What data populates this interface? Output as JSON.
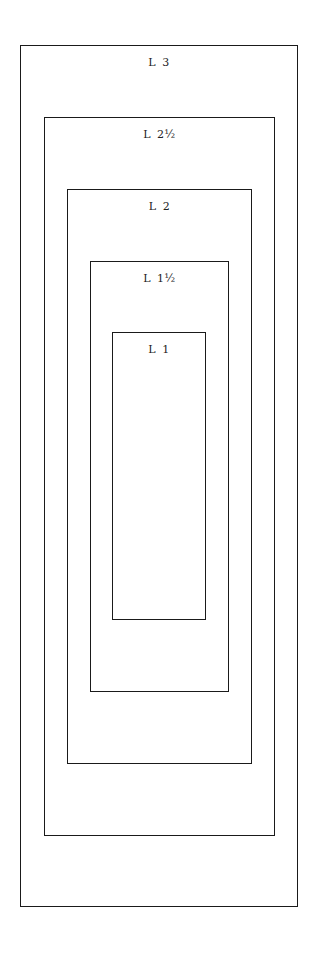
{
  "diagram": {
    "stroke_color": "#1a1a1a",
    "text_color": "#222222",
    "background": "#ffffff",
    "boxes": [
      {
        "label": "L 3",
        "x": 20,
        "y": 45,
        "w": 278,
        "h": 862,
        "label_top": 10
      },
      {
        "label": "L 2½",
        "x": 44,
        "y": 117,
        "w": 231,
        "h": 719,
        "label_top": 10
      },
      {
        "label": "L 2",
        "x": 67,
        "y": 189,
        "w": 185,
        "h": 575,
        "label_top": 10
      },
      {
        "label": "L 1½",
        "x": 90,
        "y": 261,
        "w": 139,
        "h": 431,
        "label_top": 10
      },
      {
        "label": "L 1",
        "x": 112,
        "y": 332,
        "w": 94,
        "h": 288,
        "label_top": 10
      }
    ]
  }
}
